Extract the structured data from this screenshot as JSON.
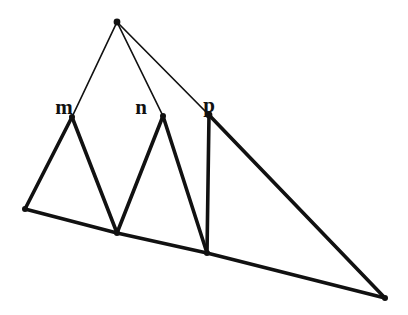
{
  "figure": {
    "canvas": {
      "width": 408,
      "height": 315,
      "background": "#ffffff"
    },
    "stroke_color": "#111111",
    "thin_stroke_width": 1.7,
    "thick_stroke_width": 3.6,
    "vertices": [
      {
        "id": "apex",
        "label": "",
        "x": 117,
        "y": 22,
        "dot": true,
        "dot_r": 3.4
      },
      {
        "id": "m",
        "label": "m",
        "x": 72,
        "y": 117,
        "dot": true,
        "dot_r": 3.0
      },
      {
        "id": "n",
        "label": "n",
        "x": 163,
        "y": 116,
        "dot": true,
        "dot_r": 3.0
      },
      {
        "id": "p",
        "label": "p",
        "x": 209,
        "y": 115,
        "dot": true,
        "dot_r": 3.4
      },
      {
        "id": "base-left",
        "label": "",
        "x": 25,
        "y": 209,
        "dot": true,
        "dot_r": 3.0
      },
      {
        "id": "base-mid",
        "label": "",
        "x": 117,
        "y": 233,
        "dot": true,
        "dot_r": 3.0
      },
      {
        "id": "base-p",
        "label": "",
        "x": 207,
        "y": 253,
        "dot": true,
        "dot_r": 3.0
      },
      {
        "id": "base-right",
        "label": "",
        "x": 385,
        "y": 298,
        "dot": true,
        "dot_r": 3.0
      }
    ],
    "edges": [
      {
        "id": "apex-m",
        "from": "apex",
        "to": "m",
        "weight": "thin"
      },
      {
        "id": "apex-n",
        "from": "apex",
        "to": "n",
        "weight": "thin"
      },
      {
        "id": "apex-p",
        "from": "apex",
        "to": "p",
        "weight": "thin"
      },
      {
        "id": "m-baseleft",
        "from": "m",
        "to": "base-left",
        "weight": "thick"
      },
      {
        "id": "m-basemid",
        "from": "m",
        "to": "base-mid",
        "weight": "thick"
      },
      {
        "id": "n-basemid",
        "from": "n",
        "to": "base-mid",
        "weight": "thick"
      },
      {
        "id": "n-basep",
        "from": "n",
        "to": "base-p",
        "weight": "thick"
      },
      {
        "id": "p-basep",
        "from": "p",
        "to": "base-p",
        "weight": "thick"
      },
      {
        "id": "p-baseright",
        "from": "p",
        "to": "base-right",
        "weight": "thick"
      },
      {
        "id": "baseline-left",
        "from": "base-left",
        "to": "base-mid",
        "weight": "thick"
      },
      {
        "id": "baseline-mid",
        "from": "base-mid",
        "to": "base-p",
        "weight": "thick"
      },
      {
        "id": "baseline-right",
        "from": "base-p",
        "to": "base-right",
        "weight": "thick"
      }
    ],
    "labels": [
      {
        "id": "label-m",
        "text": "m",
        "x": 64,
        "y": 114,
        "font_size": 21
      },
      {
        "id": "label-n",
        "text": "n",
        "x": 141,
        "y": 114,
        "font_size": 21
      },
      {
        "id": "label-p",
        "text": "p",
        "x": 209,
        "y": 112,
        "font_size": 21
      }
    ]
  }
}
